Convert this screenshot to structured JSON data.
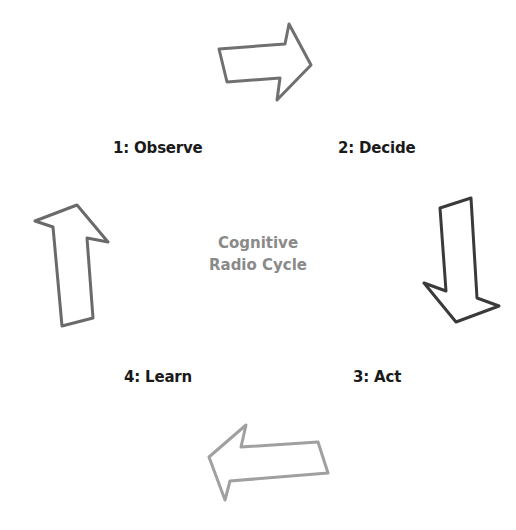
{
  "diagram": {
    "title_line1": "Cognitive",
    "title_line2": "Radio Cycle",
    "title_color": "#8a8a8a",
    "steps": [
      {
        "label": "1: Observe"
      },
      {
        "label": "2: Decide"
      },
      {
        "label": "3: Act"
      },
      {
        "label": "4: Learn"
      }
    ],
    "arrows": [
      {
        "name": "observe-to-decide",
        "direction": "right",
        "color": "#707070"
      },
      {
        "name": "decide-to-act",
        "direction": "down",
        "color": "#3a3a3a"
      },
      {
        "name": "act-to-learn",
        "direction": "left",
        "color": "#a0a0a0"
      },
      {
        "name": "learn-to-observe",
        "direction": "up",
        "color": "#6a6a6a"
      }
    ]
  }
}
